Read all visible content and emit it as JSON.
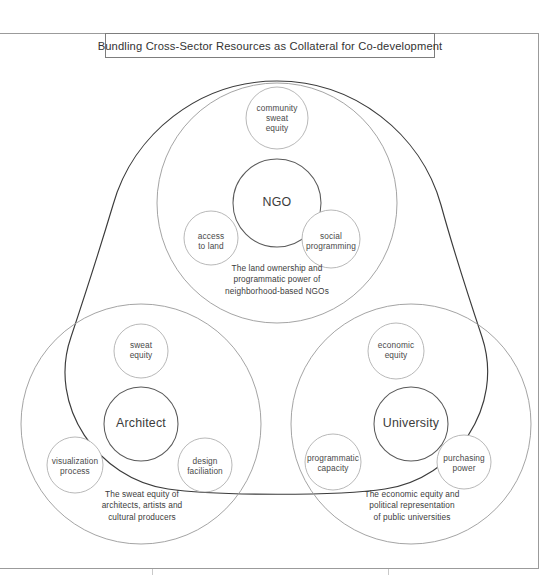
{
  "title": {
    "text": "Bundling Cross-Sector Resources as Collateral for Co-development"
  },
  "diagram": {
    "type": "venn-cluster-triangle",
    "outline_color": "#3b3b3b",
    "circle_color": "#9a9a9a",
    "core_circle_color": "#5a5a5a",
    "clusters": [
      {
        "id": "ngo",
        "core_label": "NGO",
        "caption": "The land ownership and programmatic power of neighborhood-based NGOs",
        "caption_lines": [
          "The land ownership and",
          "programmatic power of",
          "neighborhood-based NGOs"
        ],
        "satellites": [
          {
            "id": "community-sweat-equity",
            "label": "community sweat equity",
            "lines": [
              "community",
              "sweat",
              "equity"
            ]
          },
          {
            "id": "access-to-land",
            "label": "access to land",
            "lines": [
              "access",
              "to land"
            ]
          },
          {
            "id": "social-programming",
            "label": "social programming",
            "lines": [
              "social",
              "programming"
            ]
          }
        ]
      },
      {
        "id": "architect",
        "core_label": "Architect",
        "caption": "The sweat equity of architects, artists and cultural producers",
        "caption_lines": [
          "The sweat equity of",
          "architects, artists and",
          "cultural producers"
        ],
        "satellites": [
          {
            "id": "sweat-equity",
            "label": "sweat equity",
            "lines": [
              "sweat",
              "equity"
            ]
          },
          {
            "id": "visualization-process",
            "label": "visualization process",
            "lines": [
              "visualization",
              "process"
            ]
          },
          {
            "id": "design-faciliation",
            "label": "design faciliation",
            "lines": [
              "design",
              "faciliation"
            ]
          }
        ]
      },
      {
        "id": "university",
        "core_label": "University",
        "caption": "The economic equity and political representation of public universities",
        "caption_lines": [
          "The economic equity and",
          "political representation",
          "of public universities"
        ],
        "satellites": [
          {
            "id": "economic-equity",
            "label": "economic equity",
            "lines": [
              "economic",
              "equity"
            ]
          },
          {
            "id": "programmatic-capacity",
            "label": "programmatic capacity",
            "lines": [
              "programmatic",
              "capacity"
            ]
          },
          {
            "id": "purchasing-power",
            "label": "purchasing power",
            "lines": [
              "purchasing",
              "power"
            ]
          }
        ]
      }
    ]
  }
}
